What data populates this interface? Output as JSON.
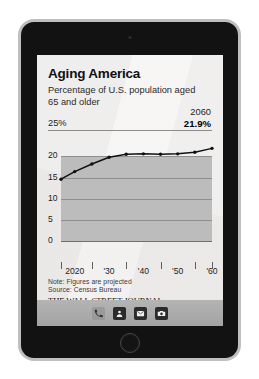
{
  "device": {
    "name": "tablet",
    "frame_color": "#bfbfbf",
    "bezel_color": "#121212",
    "home_button_name": "home-button",
    "camera_name": "front-camera"
  },
  "screen": {
    "background": "#f1f0ef"
  },
  "chart_data": {
    "type": "line",
    "title": "Aging America",
    "subtitle": "Percentage of U.S. population aged 65 and older",
    "xlabel": "",
    "ylabel": "",
    "ylim": [
      0,
      25
    ],
    "yticks": [
      0,
      5,
      10,
      15,
      20
    ],
    "ytick_labels": [
      "0",
      "5",
      "10",
      "15",
      "20"
    ],
    "top_axis_label": "25%",
    "grid": true,
    "grid_orientation": "horizontal",
    "legend": "none",
    "xlim": [
      2016,
      2060
    ],
    "x_tick_labels": [
      "2020",
      "'30",
      "'40",
      "'50",
      "'60"
    ],
    "x_tick_values": [
      2020,
      2030,
      2040,
      2050,
      2060
    ],
    "x": [
      2016,
      2020,
      2025,
      2030,
      2035,
      2040,
      2045,
      2050,
      2055,
      2060
    ],
    "values": [
      14.6,
      16.4,
      18.2,
      19.8,
      20.5,
      20.6,
      20.5,
      20.6,
      21.0,
      21.9
    ],
    "series": [
      {
        "name": "Percentage of U.S. population aged 65 and older",
        "values": [
          14.6,
          16.4,
          18.2,
          19.8,
          20.5,
          20.6,
          20.5,
          20.6,
          21.0,
          21.9
        ]
      }
    ],
    "area_fill": true,
    "area_fill_color": "#bcbcbc",
    "line_color": "#111111",
    "marker": "circle",
    "annotations": [
      {
        "name": "endpoint-callout",
        "year": "2060",
        "value": "21.9%"
      }
    ]
  },
  "footer": {
    "note": "Note: Figures are projected",
    "source": "Source: Census Bureau",
    "brand": "THE WALL STREET JOURNAL."
  },
  "dock": {
    "items": [
      {
        "icon": "phone-icon",
        "style": "light"
      },
      {
        "icon": "contacts-icon",
        "style": "dark"
      },
      {
        "icon": "mail-icon",
        "style": "dark"
      },
      {
        "icon": "camera-icon",
        "style": "dark"
      }
    ]
  }
}
